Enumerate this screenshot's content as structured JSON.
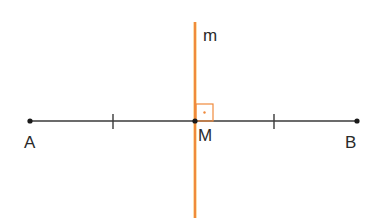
{
  "diagram": {
    "title": "",
    "colors": {
      "segment": "#3a3a3a",
      "bisector": "#f08a3c",
      "bisector_highlight": "#f7c46a",
      "right_angle_mark": "#f08a3c",
      "points": "#1a1a1a",
      "labels": "#2a2a2a"
    },
    "points": [
      {
        "id": "A",
        "label": "A",
        "x": 30,
        "y": 121
      },
      {
        "id": "M",
        "label": "M",
        "x": 195,
        "y": 121
      },
      {
        "id": "B",
        "label": "B",
        "x": 357,
        "y": 121
      }
    ],
    "segment": {
      "from": "A",
      "to": "B"
    },
    "tick_marks": [
      {
        "x": 113,
        "y": 121,
        "meaning": "midpoint of AM"
      },
      {
        "x": 274,
        "y": 121,
        "meaning": "midpoint of MB"
      }
    ],
    "line_m": {
      "label": "m",
      "x": 195,
      "y_top": 22,
      "y_bottom": 218
    },
    "right_angle": {
      "x": 195,
      "y": 104,
      "size": 17
    }
  }
}
